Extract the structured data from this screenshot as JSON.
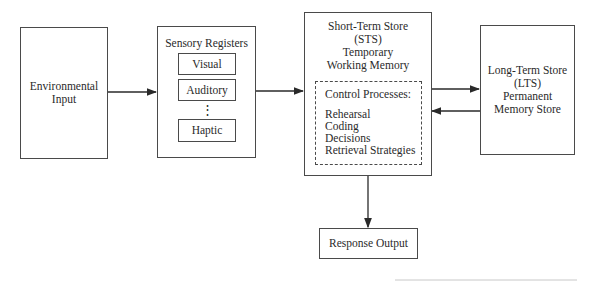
{
  "diagram": {
    "environmental_input": {
      "lines": [
        "Environmental",
        "Input"
      ]
    },
    "sensory_registers": {
      "title": "Sensory Registers",
      "registers": [
        "Visual",
        "Auditory",
        "Haptic"
      ],
      "ellipsis": "⋮"
    },
    "short_term_store": {
      "lines": [
        "Short-Term Store",
        "(STS)",
        "Temporary",
        "Working Memory"
      ],
      "control_processes": {
        "title": "Control Processes:",
        "items": [
          "Rehearsal",
          "Coding",
          "Decisions",
          "Retrieval Strategies"
        ]
      }
    },
    "long_term_store": {
      "lines": [
        "Long-Term Store",
        "(LTS)",
        "Permanent",
        "Memory Store"
      ]
    },
    "response_output": {
      "label": "Response Output"
    },
    "connections": [
      {
        "from": "Environmental Input",
        "to": "Sensory Registers"
      },
      {
        "from": "Sensory Registers",
        "to": "Short-Term Store"
      },
      {
        "from": "Short-Term Store",
        "to": "Long-Term Store"
      },
      {
        "from": "Long-Term Store",
        "to": "Short-Term Store"
      },
      {
        "from": "Short-Term Store",
        "to": "Response Output"
      }
    ]
  }
}
